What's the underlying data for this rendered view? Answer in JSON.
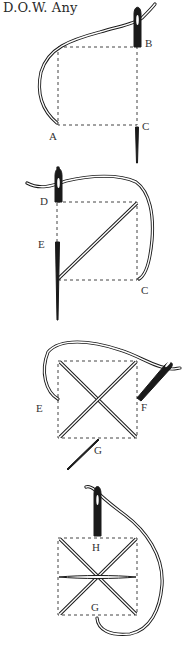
{
  "title": "D.O.W. Any",
  "panels": [
    {
      "step": 1,
      "labels": {
        "a": "A",
        "b": "B",
        "c": "C"
      }
    },
    {
      "step": 2,
      "labels": {
        "d": "D",
        "e": "E",
        "c": "C"
      }
    },
    {
      "step": 3,
      "labels": {
        "e": "E",
        "f": "F",
        "g": "G"
      }
    },
    {
      "step": 4,
      "labels": {
        "h": "H",
        "g": "G"
      }
    }
  ],
  "colors": {
    "ink": "#1a1a1a",
    "paper": "#ffffff",
    "dash": "#444444"
  }
}
